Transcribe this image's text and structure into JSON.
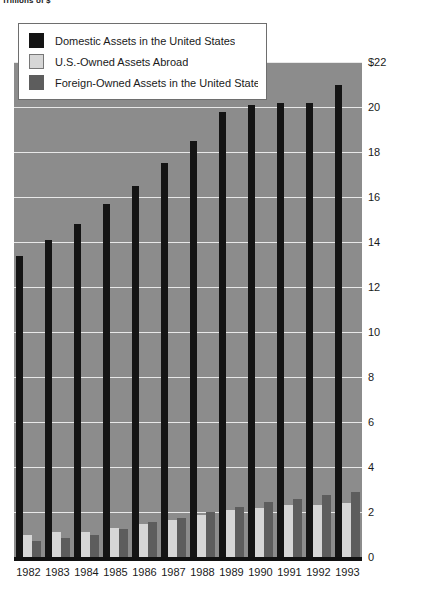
{
  "chart_data": {
    "type": "bar",
    "title": "Trillions of $",
    "xlabel": "",
    "ylabel": "Trillions of $",
    "ylim": [
      0,
      22
    ],
    "ytick_values": [
      0,
      2,
      4,
      6,
      8,
      10,
      12,
      14,
      16,
      18,
      20,
      22
    ],
    "ytick_labels": [
      "0",
      "2",
      "4",
      "6",
      "8",
      "10",
      "12",
      "14",
      "16",
      "18",
      "20",
      "$22"
    ],
    "grid": true,
    "legend_position": "top-left",
    "categories": [
      "1982",
      "1983",
      "1984",
      "1985",
      "1986",
      "1987",
      "1988",
      "1989",
      "1990",
      "1991",
      "1992",
      "1993"
    ],
    "series": [
      {
        "name": "Domestic Assets in the United States",
        "color": "#141414",
        "values": [
          13.4,
          14.1,
          14.8,
          15.7,
          16.5,
          17.5,
          18.5,
          19.8,
          20.1,
          20.2,
          20.2,
          21.0
        ]
      },
      {
        "name": "U.S.-Owned Assets Abroad",
        "color": "#d6d6d6",
        "values": [
          0.96,
          1.13,
          1.13,
          1.29,
          1.47,
          1.65,
          1.86,
          2.08,
          2.18,
          2.29,
          2.33,
          2.42
        ]
      },
      {
        "name": "Foreign-Owned Assets in the United States",
        "color": "#5d5d5d",
        "values": [
          0.69,
          0.86,
          0.98,
          1.25,
          1.54,
          1.73,
          2.02,
          2.22,
          2.45,
          2.58,
          2.77,
          2.91
        ]
      }
    ]
  },
  "legend": {
    "items": [
      {
        "label": "Domestic Assets in the United States",
        "swatch": "black-swatch"
      },
      {
        "label": "U.S.-Owned Assets Abroad",
        "swatch": "light-gray-swatch"
      },
      {
        "label": "Foreign-Owned Assets in the United States",
        "swatch": "dark-gray-swatch"
      }
    ]
  },
  "colors": {
    "plot_background": "#8c8c8c",
    "gridline": "#e8e8e8",
    "baseline": "#111111",
    "page_background": "#ffffff",
    "text": "#1a1a1a"
  }
}
